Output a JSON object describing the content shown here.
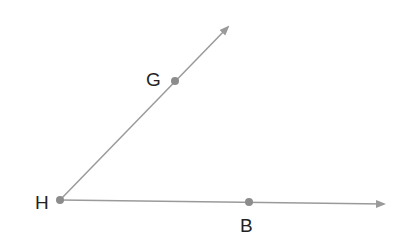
{
  "diagram": {
    "vertex": {
      "id": "H",
      "label": "H"
    },
    "rays": [
      {
        "id": "ray-HG",
        "from": "H",
        "through": "G"
      },
      {
        "id": "ray-HB",
        "from": "H",
        "through": "B"
      }
    ],
    "points": [
      {
        "id": "H",
        "label": "H"
      },
      {
        "id": "G",
        "label": "G"
      },
      {
        "id": "B",
        "label": "B"
      }
    ],
    "colors": {
      "line": "#9a9a9a",
      "point": "#8c8c8c",
      "label": "#222222",
      "background": "#ffffff"
    }
  }
}
